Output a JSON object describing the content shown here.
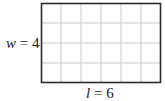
{
  "diagram": {
    "type": "rectangle-grid",
    "columns": 6,
    "rows": 4,
    "colors": {
      "border": "#2b2b2b",
      "grid_line": "#c8c8c8",
      "fill": "#ffffff",
      "text": "#1a1a1a"
    },
    "width_label": {
      "variable": "w",
      "equals": " = ",
      "value": "4"
    },
    "length_label": {
      "variable": "l",
      "equals": " = ",
      "value": "6"
    }
  }
}
